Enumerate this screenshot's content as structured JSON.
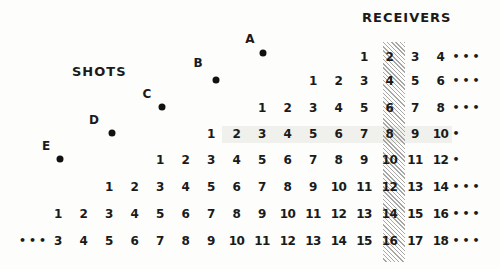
{
  "labels": {
    "receivers": "RECEIVERS",
    "shots": "SHOTS"
  },
  "shots": [
    {
      "name": "A",
      "label_x": 250,
      "label_y": 39,
      "dot_x": 263,
      "dot_y": 53
    },
    {
      "name": "B",
      "label_x": 198,
      "label_y": 63,
      "dot_x": 216,
      "dot_y": 80
    },
    {
      "name": "C",
      "label_x": 147,
      "label_y": 94,
      "dot_x": 162,
      "dot_y": 107
    },
    {
      "name": "D",
      "label_x": 94,
      "label_y": 120,
      "dot_x": 112,
      "dot_y": 133
    },
    {
      "name": "E",
      "label_x": 46,
      "label_y": 146,
      "dot_x": 60,
      "dot_y": 159
    }
  ],
  "grid": {
    "col_x0": 58,
    "col_spacing": 25.5,
    "row_y": [
      57,
      81,
      108,
      134,
      160,
      187,
      214,
      241
    ],
    "highlight_column": 13,
    "highlight_row": 3
  },
  "rows": [
    {
      "start_col": 12,
      "values": [
        "1",
        "2",
        "3",
        "4"
      ],
      "leading": "",
      "trailing": "•••"
    },
    {
      "start_col": 10,
      "values": [
        "1",
        "2",
        "3",
        "4",
        "5",
        "6"
      ],
      "leading": "",
      "trailing": "•••"
    },
    {
      "start_col": 8,
      "values": [
        "1",
        "2",
        "3",
        "4",
        "5",
        "6",
        "7",
        "8"
      ],
      "leading": "",
      "trailing": "•••"
    },
    {
      "start_col": 6,
      "values": [
        "1",
        "2",
        "3",
        "4",
        "5",
        "6",
        "7",
        "8",
        "9",
        "10"
      ],
      "leading": "",
      "trailing": "•"
    },
    {
      "start_col": 4,
      "values": [
        "1",
        "2",
        "3",
        "4",
        "5",
        "6",
        "7",
        "8",
        "9",
        "10",
        "11",
        "12"
      ],
      "leading": "",
      "trailing": "•"
    },
    {
      "start_col": 2,
      "values": [
        "1",
        "2",
        "3",
        "4",
        "5",
        "6",
        "7",
        "8",
        "9",
        "10",
        "11",
        "12",
        "13",
        "14"
      ],
      "leading": "",
      "trailing": "•••"
    },
    {
      "start_col": 0,
      "values": [
        "1",
        "2",
        "3",
        "4",
        "5",
        "6",
        "7",
        "8",
        "9",
        "10",
        "11",
        "12",
        "13",
        "14",
        "15",
        "16"
      ],
      "leading": "",
      "trailing": "•••"
    },
    {
      "start_col": 0,
      "values": [
        "3",
        "4",
        "5",
        "6",
        "7",
        "8",
        "9",
        "10",
        "11",
        "12",
        "13",
        "14",
        "15",
        "16",
        "17",
        "18"
      ],
      "leading": "•••",
      "trailing": "•••"
    }
  ],
  "highlighted_receivers": [
    "2",
    "4",
    "6",
    "8",
    "10",
    "12",
    "14",
    "16"
  ]
}
